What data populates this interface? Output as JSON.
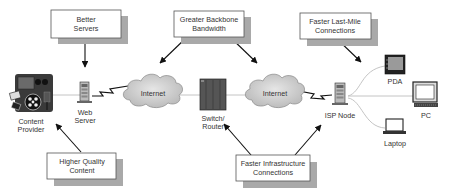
{
  "diagram": {
    "type": "network-flow",
    "nodes": [
      {
        "id": "content-provider",
        "label_lines": [
          "Content",
          "Provider"
        ]
      },
      {
        "id": "web-server",
        "label_lines": [
          "Web",
          "Server"
        ]
      },
      {
        "id": "internet-left",
        "label_lines": [
          "Internet"
        ]
      },
      {
        "id": "switch-router",
        "label_lines": [
          "Switch/",
          "Router"
        ]
      },
      {
        "id": "internet-right",
        "label_lines": [
          "Internet"
        ]
      },
      {
        "id": "isp-node",
        "label_lines": [
          "ISP Node"
        ]
      },
      {
        "id": "pda",
        "label_lines": [
          "PDA"
        ]
      },
      {
        "id": "pc",
        "label_lines": [
          "PC"
        ]
      },
      {
        "id": "laptop",
        "label_lines": [
          "Laptop"
        ]
      }
    ],
    "callouts": [
      {
        "id": "better-servers",
        "lines": [
          "Better",
          "Servers"
        ],
        "points_to": [
          "web-server"
        ]
      },
      {
        "id": "greater-backbone-bandwidth",
        "lines": [
          "Greater Backbone",
          "Bandwidth"
        ],
        "points_to": [
          "internet-left",
          "internet-right"
        ]
      },
      {
        "id": "faster-last-mile",
        "lines": [
          "Faster Last-Mile",
          "Connections"
        ],
        "points_to": [
          "isp-node-to-devices"
        ]
      },
      {
        "id": "higher-quality-content",
        "lines": [
          "Higher Quality",
          "Content"
        ],
        "points_to": [
          "content-provider"
        ]
      },
      {
        "id": "faster-infrastructure",
        "lines": [
          "Faster Infrastructure",
          "Connections"
        ],
        "points_to": [
          "switch-router",
          "isp-node"
        ]
      }
    ],
    "edges": [
      {
        "from": "content-provider",
        "to": "web-server",
        "style": "line"
      },
      {
        "from": "web-server",
        "to": "internet-left",
        "style": "lightning"
      },
      {
        "from": "internet-left",
        "to": "switch-router",
        "style": "line"
      },
      {
        "from": "switch-router",
        "to": "internet-right",
        "style": "line"
      },
      {
        "from": "internet-right",
        "to": "isp-node",
        "style": "lightning"
      },
      {
        "from": "isp-node",
        "to": "pda",
        "style": "curve"
      },
      {
        "from": "isp-node",
        "to": "pc",
        "style": "line"
      },
      {
        "from": "isp-node",
        "to": "laptop",
        "style": "curve"
      }
    ]
  },
  "colors": {
    "callout_shadow": "#a9a9a9",
    "cloud_fill": "#d4d4d4",
    "link": "#bdbdbd",
    "arrow": "#111111"
  }
}
